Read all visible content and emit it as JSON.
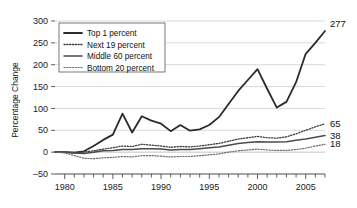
{
  "chart_data": {
    "type": "line",
    "title": "",
    "xlabel": "",
    "ylabel": "Percentage Change",
    "xlim": [
      1979,
      2007
    ],
    "ylim": [
      -50,
      300
    ],
    "grid": true,
    "legend_position": "upper-left",
    "y_ticks": [
      "300",
      "250",
      "200",
      "150",
      "100",
      "50",
      "0",
      "-50"
    ],
    "y_tick_values": [
      300,
      250,
      200,
      150,
      100,
      50,
      0,
      -50
    ],
    "x_ticks": [
      "1980",
      "1985",
      "1990",
      "1995",
      "2000",
      "2005"
    ],
    "x_tick_values": [
      1980,
      1985,
      1990,
      1995,
      2000,
      2005
    ],
    "x": [
      1979,
      1980,
      1981,
      1982,
      1983,
      1984,
      1985,
      1986,
      1987,
      1988,
      1989,
      1990,
      1991,
      1992,
      1993,
      1994,
      1995,
      1996,
      1997,
      1998,
      1999,
      2000,
      2001,
      2002,
      2003,
      2004,
      2005,
      2006,
      2007
    ],
    "series": [
      {
        "name": "Top 1 percent",
        "style": "solid",
        "width": 1.8,
        "color": "#2b2b2b",
        "end_label": "277",
        "values": [
          0,
          0,
          -1,
          2,
          14,
          28,
          40,
          88,
          45,
          82,
          72,
          65,
          48,
          62,
          49,
          52,
          62,
          80,
          110,
          140,
          165,
          190,
          145,
          102,
          115,
          160,
          225,
          250,
          277
        ]
      },
      {
        "name": "Next 19 percent",
        "style": "dotted",
        "width": 1.3,
        "color": "#3a3a3a",
        "end_label": "65",
        "values": [
          0,
          0,
          -1,
          0,
          3,
          7,
          10,
          14,
          13,
          18,
          16,
          14,
          11,
          13,
          12,
          14,
          17,
          20,
          25,
          30,
          33,
          36,
          33,
          32,
          35,
          42,
          50,
          58,
          65
        ]
      },
      {
        "name": "Middle 60 percent",
        "style": "solid",
        "width": 1.5,
        "color": "#4a4a4a",
        "end_label": "38",
        "values": [
          0,
          0,
          -2,
          -3,
          0,
          3,
          4,
          6,
          6,
          8,
          8,
          7,
          5,
          6,
          6,
          8,
          10,
          12,
          16,
          20,
          22,
          24,
          23,
          23,
          24,
          27,
          30,
          34,
          38
        ]
      },
      {
        "name": "Bottom 20 percent",
        "style": "dotted",
        "width": 1.2,
        "color": "#6a6a6a",
        "end_label": "18",
        "values": [
          0,
          -2,
          -8,
          -14,
          -15,
          -13,
          -12,
          -10,
          -11,
          -8,
          -8,
          -9,
          -11,
          -10,
          -10,
          -8,
          -6,
          -4,
          0,
          3,
          5,
          7,
          5,
          4,
          4,
          6,
          9,
          14,
          18
        ]
      }
    ]
  },
  "legend": {
    "items": [
      {
        "label": "Top 1 percent",
        "style": "solid"
      },
      {
        "label": "Next 19 percent",
        "style": "dotted"
      },
      {
        "label": "Middle 60 percent",
        "style": "solid"
      },
      {
        "label": "Bottom 20 percent",
        "style": "dotted"
      }
    ]
  },
  "colors": {
    "grid": "#cfcfcf",
    "axis": "#4d4d4d",
    "text": "#1a1a1a",
    "background": "#ffffff"
  }
}
